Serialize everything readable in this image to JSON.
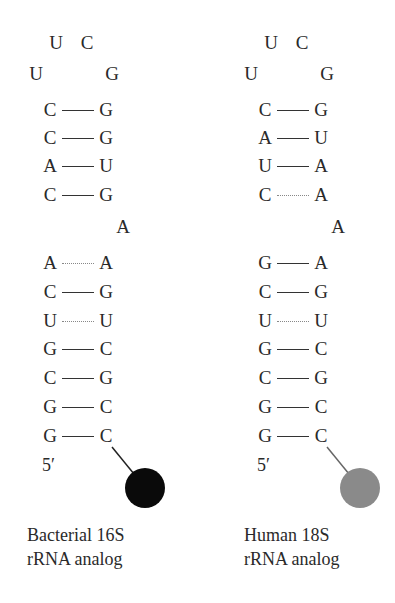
{
  "panels": [
    {
      "id": "bacterial",
      "loop": {
        "top_left": "U",
        "top_right": "C",
        "mid_left": "U",
        "mid_right": "G"
      },
      "stem_upper": [
        {
          "left": "C",
          "right": "G",
          "bond": "solid"
        },
        {
          "left": "C",
          "right": "G",
          "bond": "solid"
        },
        {
          "left": "A",
          "right": "U",
          "bond": "solid"
        },
        {
          "left": "C",
          "right": "G",
          "bond": "solid"
        }
      ],
      "bulge": "A",
      "stem_lower": [
        {
          "left": "A",
          "right": "A",
          "bond": "weak"
        },
        {
          "left": "C",
          "right": "G",
          "bond": "solid"
        },
        {
          "left": "U",
          "right": "U",
          "bond": "weak"
        },
        {
          "left": "G",
          "right": "C",
          "bond": "solid"
        },
        {
          "left": "C",
          "right": "G",
          "bond": "solid"
        },
        {
          "left": "G",
          "right": "C",
          "bond": "solid"
        },
        {
          "left": "G",
          "right": "C",
          "bond": "solid"
        }
      ],
      "five_prime": "5′",
      "bead_color": "#0a0a0a",
      "caption_line1": "Bacterial 16S",
      "caption_line2": "rRNA analog"
    },
    {
      "id": "human",
      "loop": {
        "top_left": "U",
        "top_right": "C",
        "mid_left": "U",
        "mid_right": "G"
      },
      "stem_upper": [
        {
          "left": "C",
          "right": "G",
          "bond": "solid"
        },
        {
          "left": "A",
          "right": "U",
          "bond": "solid"
        },
        {
          "left": "U",
          "right": "A",
          "bond": "solid"
        },
        {
          "left": "C",
          "right": "A",
          "bond": "weak"
        }
      ],
      "bulge": "A",
      "stem_lower": [
        {
          "left": "G",
          "right": "A",
          "bond": "solid"
        },
        {
          "left": "C",
          "right": "G",
          "bond": "solid"
        },
        {
          "left": "U",
          "right": "U",
          "bond": "weak"
        },
        {
          "left": "G",
          "right": "C",
          "bond": "solid"
        },
        {
          "left": "C",
          "right": "G",
          "bond": "solid"
        },
        {
          "left": "G",
          "right": "C",
          "bond": "solid"
        },
        {
          "left": "G",
          "right": "C",
          "bond": "solid"
        }
      ],
      "five_prime": "5′",
      "bead_color": "#8a8a8a",
      "caption_line1": "Human 18S",
      "caption_line2": "rRNA analog"
    }
  ]
}
